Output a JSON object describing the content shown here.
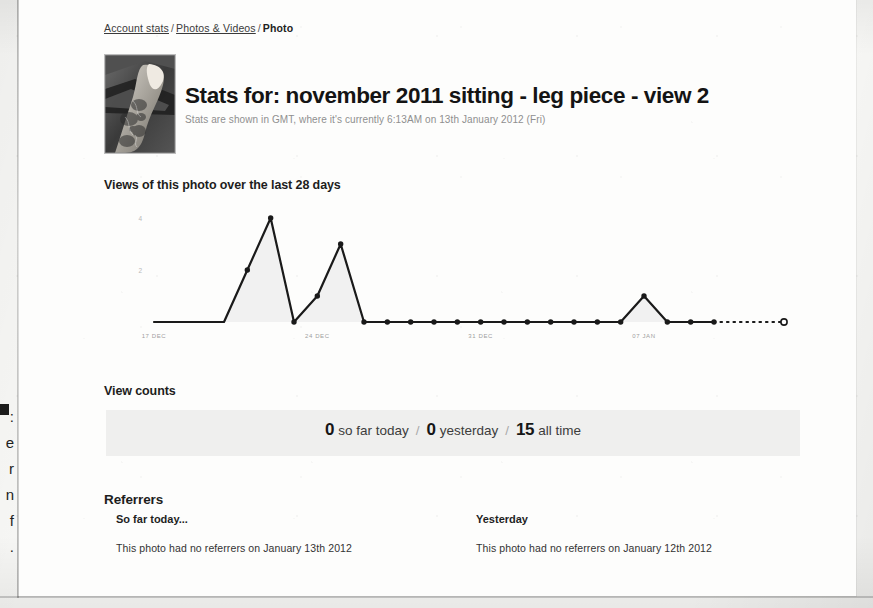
{
  "breadcrumb": {
    "items": [
      {
        "label": "Account stats",
        "link": true
      },
      {
        "label": "Photos & Videos",
        "link": true
      },
      {
        "label": "Photo",
        "link": false
      }
    ],
    "separator": "/"
  },
  "header": {
    "title": "Stats for: november 2011 sitting - leg piece - view 2",
    "subtitle": "Stats are shown in GMT, where it's currently 6:13AM on 13th January 2012 (Fri)",
    "thumbnail_alt": "photo-thumbnail"
  },
  "chart_section": {
    "heading": "Views of this photo over the last 28 days"
  },
  "view_counts": {
    "heading": "View counts",
    "today_value": "0",
    "today_label": "so far today",
    "yesterday_value": "0",
    "yesterday_label": "yesterday",
    "alltime_value": "15",
    "alltime_label": "all time",
    "separator": "/"
  },
  "referrers": {
    "heading": "Referrers",
    "today": {
      "subheading": "So far today...",
      "message": "This photo had no referrers on January 13th 2012"
    },
    "yesterday": {
      "subheading": "Yesterday",
      "message": "This photo had no referrers on January 12th 2012"
    }
  },
  "margin_text": {
    "lines": [
      ":",
      "e",
      "r",
      "n",
      "f",
      "."
    ]
  },
  "colors": {
    "page": "#fdfdfc",
    "ink": "#1d1d1d",
    "muted": "#8f8f8f",
    "band": "#efefee",
    "chart_line": "#1a1a1a",
    "chart_fill": "#f0f0f0"
  },
  "chart_data": {
    "type": "line",
    "title": "Views of this photo over the last 28 days",
    "xlabel": "",
    "ylabel": "views",
    "ylim": [
      0,
      4
    ],
    "yticks": [
      2,
      4
    ],
    "ytick_labels": [
      "2",
      "4"
    ],
    "grid": false,
    "legend": null,
    "x": [
      "17 DEC",
      "18 DEC",
      "19 DEC",
      "20 DEC",
      "21 DEC",
      "22 DEC",
      "23 DEC",
      "24 DEC",
      "25 DEC",
      "26 DEC",
      "27 DEC",
      "28 DEC",
      "29 DEC",
      "30 DEC",
      "31 DEC",
      "01 JAN",
      "02 JAN",
      "03 JAN",
      "04 JAN",
      "05 JAN",
      "06 JAN",
      "07 JAN",
      "08 JAN",
      "09 JAN",
      "10 JAN",
      "11 JAN",
      "12 JAN",
      "13 JAN"
    ],
    "values": [
      0,
      0,
      0,
      0,
      2,
      4,
      0,
      1,
      3,
      0,
      0,
      0,
      0,
      0,
      0,
      0,
      0,
      0,
      0,
      0,
      0,
      1,
      0,
      0,
      0,
      0,
      0,
      0
    ],
    "xtick_labels": [
      "17 DEC",
      "24 DEC",
      "31 DEC",
      "07 JAN"
    ],
    "xtick_indices": [
      0,
      7,
      14,
      21
    ],
    "last_point_marker": "open-circle",
    "dashed_tail_from_index": 24
  }
}
